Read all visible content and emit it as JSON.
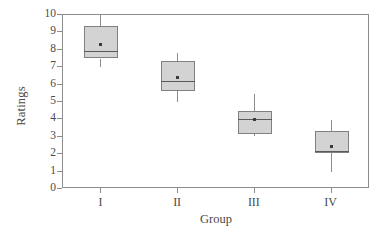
{
  "chart_data": {
    "type": "box",
    "title": "",
    "xlabel": "Group",
    "ylabel": "Ratings",
    "categories": [
      "I",
      "II",
      "III",
      "IV"
    ],
    "ylim": [
      0,
      10
    ],
    "yticks": [
      0,
      1,
      2,
      3,
      4,
      5,
      6,
      7,
      8,
      9,
      10
    ],
    "ytick_labels": [
      "0",
      "1",
      "2",
      "3",
      "4",
      "5",
      "6",
      "7",
      "8",
      "9",
      "10"
    ],
    "grid": false,
    "legend": null,
    "box_fill_color": "#d3d3d3",
    "box_edge_color": "#808080",
    "axis_color": "#8c8c8c",
    "text_color": "#4a4a4a",
    "boxes": [
      {
        "category": "I",
        "whisker_low": 7.0,
        "q1": 7.5,
        "median": 7.95,
        "mean": 8.3,
        "q3": 9.35,
        "whisker_high": 10.0
      },
      {
        "category": "II",
        "whisker_low": 5.0,
        "q1": 5.65,
        "median": 6.2,
        "mean": 6.4,
        "q3": 7.35,
        "whisker_high": 7.8
      },
      {
        "category": "III",
        "whisker_low": 3.05,
        "q1": 3.15,
        "median": 4.0,
        "mean": 4.0,
        "q3": 4.5,
        "whisker_high": 5.45
      },
      {
        "category": "IV",
        "whisker_low": 1.0,
        "q1": 2.05,
        "median": 2.2,
        "mean": 2.45,
        "q3": 3.35,
        "whisker_high": 3.95
      }
    ]
  }
}
